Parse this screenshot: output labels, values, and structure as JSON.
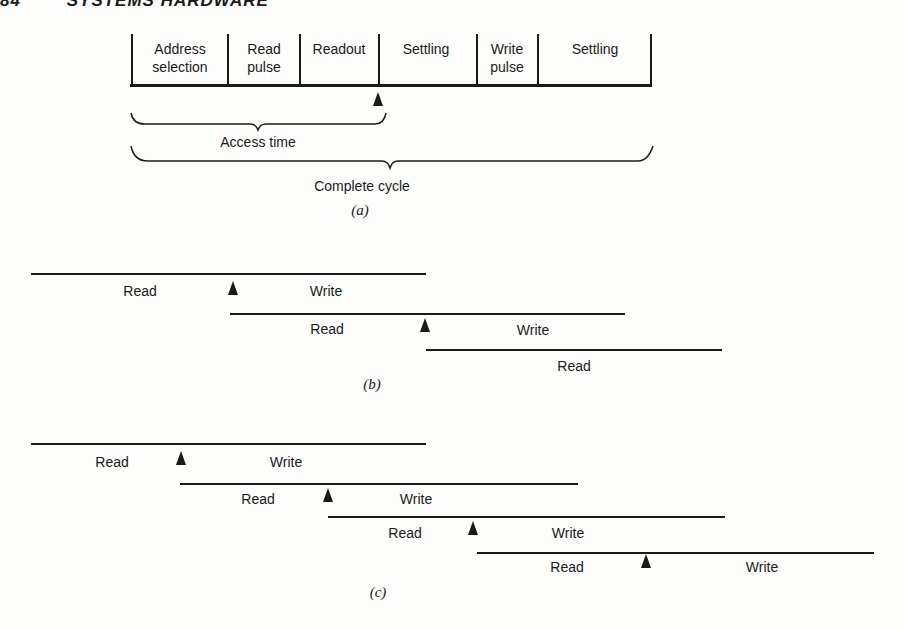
{
  "header": {
    "page_number": "84",
    "section_title": "SYSTEMS HARDWARE"
  },
  "part_a": {
    "caption": "(a)",
    "segments": [
      {
        "label_line1": "Address",
        "label_line2": "selection"
      },
      {
        "label_line1": "Read",
        "label_line2": "pulse"
      },
      {
        "label_line1": "Readout",
        "label_line2": ""
      },
      {
        "label_line1": "Settling",
        "label_line2": ""
      },
      {
        "label_line1": "Write",
        "label_line2": "pulse"
      },
      {
        "label_line1": "Settling",
        "label_line2": ""
      }
    ],
    "access_time_label": "Access time",
    "complete_cycle_label": "Complete cycle"
  },
  "part_b": {
    "caption": "(b)",
    "cycles": [
      {
        "read": "Read",
        "write": "Write"
      },
      {
        "read": "Read",
        "write": "Write"
      },
      {
        "read": "Read",
        "write": ""
      }
    ]
  },
  "part_c": {
    "caption": "(c)",
    "cycles": [
      {
        "read": "Read",
        "write": "Write"
      },
      {
        "read": "Read",
        "write": "Write"
      },
      {
        "read": "Read",
        "write": "Write"
      },
      {
        "read": "Read",
        "write": "Write"
      }
    ]
  }
}
